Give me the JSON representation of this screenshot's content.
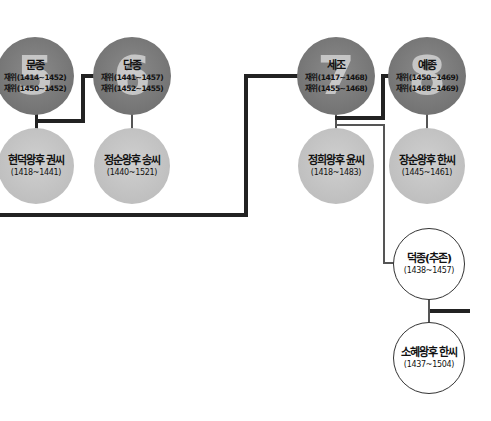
{
  "diagram": {
    "type": "family-tree",
    "colors": {
      "king": "#777777",
      "queen": "#c2c2c2",
      "outline_node": "#ffffff",
      "line": "#222222"
    },
    "kings": [
      {
        "id": "munjong",
        "number": "5",
        "name": "문종",
        "reign_line1": "재위(1414~1452)",
        "reign_line2": "재위(1450~1452)"
      },
      {
        "id": "danjong",
        "number": "6",
        "name": "단종",
        "reign_line1": "재위(1441~1457)",
        "reign_line2": "재위(1452~1455)"
      },
      {
        "id": "sejo",
        "number": "7",
        "name": "세조",
        "reign_line1": "재위(1417~1468)",
        "reign_line2": "재위(1455~1468)"
      },
      {
        "id": "yejong",
        "number": "8",
        "name": "예종",
        "reign_line1": "재위(1450~1469)",
        "reign_line2": "재위(1468~1469)"
      }
    ],
    "queens": [
      {
        "id": "hyeondeok",
        "name": "현덕왕후 권씨",
        "years": "(1418~1441)"
      },
      {
        "id": "jeongsun",
        "name": "정순왕후 송씨",
        "years": "(1440~1521)"
      },
      {
        "id": "jeonghui",
        "name": "정희왕후 윤씨",
        "years": "(1418~1483)"
      },
      {
        "id": "jangsun",
        "name": "장순왕후 한씨",
        "years": "(1445~1461)"
      }
    ],
    "others": [
      {
        "id": "deokjong",
        "name": "덕종(추존)",
        "years": "(1438~1457)"
      },
      {
        "id": "sohye",
        "name": "소혜왕후 한씨",
        "years": "(1437~1504)"
      }
    ]
  }
}
